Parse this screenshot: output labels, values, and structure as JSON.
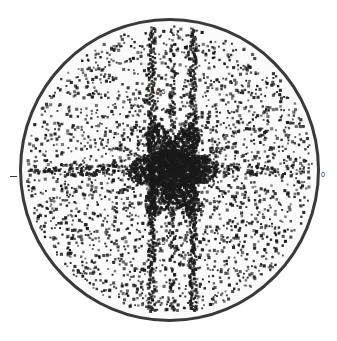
{
  "figure": {
    "name": "circular-diffraction-scatter-plot",
    "background_color": "#ffffff",
    "disc_fill_color": "#fbfbfb",
    "disc_border_color": "#3a3a3a",
    "point_color": "#1a1a1a"
  },
  "axis": {
    "y_positive_label": "0.5",
    "y_negative_label": "-0.5",
    "x_negative_label": "-0.5",
    "x_right_label": "0",
    "tick_left_label": "-"
  },
  "chart_data": {
    "type": "scatter",
    "title": "",
    "subtitle": "",
    "xlabel": "",
    "ylabel": "",
    "xlim": [
      -1.0,
      1.0
    ],
    "ylim": [
      -1.0,
      1.0
    ],
    "grid": false,
    "legend": null,
    "clip_shape": "circle",
    "clip_radius": 1.0,
    "marker": "square",
    "marker_size_px": 2.4,
    "point_color": "#1a1a1a",
    "annotations": [
      {
        "text": "0.5",
        "x": -0.09,
        "y": 0.56,
        "role": "y-axis-tick-label"
      },
      {
        "text": "-0.5",
        "x": -0.1,
        "y": -0.47,
        "role": "y-axis-tick-label"
      },
      {
        "text": "-0.5",
        "x": -0.52,
        "y": 0.02,
        "role": "x-axis-tick-label"
      },
      {
        "text": "0",
        "x": 1.03,
        "y": 0.02,
        "role": "x-axis-tick-label"
      }
    ],
    "features": [
      {
        "kind": "background-speckle",
        "description": "uniform random dark specks filling the disc",
        "count": 2600,
        "density_falloff": "slightly denser toward centre"
      },
      {
        "kind": "vertical-streak",
        "x": -0.12,
        "description": "dense vertical line of points spanning full disc height",
        "width": 0.018
      },
      {
        "kind": "vertical-streak",
        "x": 0.16,
        "description": "dense vertical line of points spanning full disc height",
        "width": 0.018
      },
      {
        "kind": "vertical-streak",
        "x": 0.02,
        "description": "broken vertical line of points through centre",
        "width": 0.014
      },
      {
        "kind": "central-star",
        "x": 0.02,
        "y": 0.0,
        "description": "dense six/eight-fold star-shaped cluster at the origin",
        "radius": 0.3
      },
      {
        "kind": "radial-spokes",
        "x": 0.02,
        "y": 0.0,
        "count": 8,
        "description": "spokes radiating from the central cluster",
        "length": 0.42
      },
      {
        "kind": "horizontal-band",
        "y": 0.0,
        "description": "dense horizontal band of points through centre",
        "height": 0.05
      }
    ],
    "series": [
      {
        "name": "diffraction spots",
        "n_points": 3100,
        "distribution": "random within unit disc plus ordered streaks and central star"
      }
    ]
  }
}
